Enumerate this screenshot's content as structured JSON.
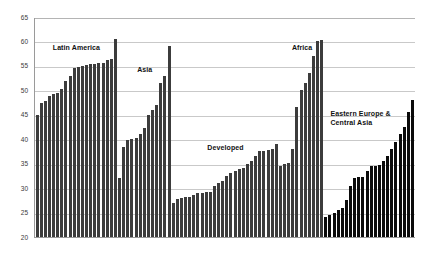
{
  "chart_data": {
    "type": "bar",
    "title": "",
    "subtitle": "",
    "xlabel": "",
    "ylabel": "",
    "ylim": [
      20,
      65
    ],
    "ytick_values": [
      20,
      25,
      30,
      35,
      40,
      45,
      50,
      55,
      60,
      65
    ],
    "ytick_labels": [
      "20",
      "25",
      "30",
      "35",
      "40",
      "45",
      "50",
      "55",
      "60",
      "65"
    ],
    "grid": "horizontal",
    "legend": "none",
    "bar_color": "#3c3c3c",
    "bar_color_alt": "#0b0b0b",
    "annotations": [
      {
        "text": "Latin America",
        "group": "Latin America"
      },
      {
        "text": "Asia",
        "group": "Asia"
      },
      {
        "text": "Developed",
        "group": "Developed"
      },
      {
        "text": "Africa",
        "group": "Africa"
      },
      {
        "text": "Eastern Europe &\nCentral Asia",
        "group": "Eastern Europe & Central Asia"
      }
    ],
    "groups": [
      {
        "name": "Latin America",
        "label": "Latin America",
        "shade": "medium",
        "values": [
          45.0,
          47.5,
          47.8,
          48.8,
          49.2,
          49.5,
          50.2,
          52.0,
          53.0,
          54.5,
          54.8,
          54.9,
          55.2,
          55.3,
          55.4,
          55.5,
          55.6,
          56.2,
          56.4,
          60.5
        ]
      },
      {
        "name": "Asia",
        "label": "Asia",
        "shade": "medium",
        "values": [
          32.0,
          38.5,
          39.8,
          40.0,
          40.2,
          41.0,
          42.3,
          45.0,
          46.0,
          47.0,
          51.5,
          53.0,
          59.0
        ]
      },
      {
        "name": "Developed",
        "label": "Developed",
        "shade": "medium",
        "values": [
          27.0,
          27.8,
          28.0,
          28.1,
          28.2,
          28.5,
          29.0,
          29.1,
          29.2,
          29.3,
          30.5,
          31.0,
          31.5,
          32.5,
          33.0,
          33.5,
          34.0,
          34.2,
          35.0,
          35.5,
          36.5,
          37.5,
          37.6,
          37.7,
          38.0,
          39.0
        ]
      },
      {
        "name": "Africa",
        "label": "Africa",
        "shade": "medium",
        "values": [
          34.5,
          35.0,
          35.2,
          38.0,
          46.5,
          50.0,
          51.5,
          53.5,
          57.0,
          60.0,
          60.2
        ]
      },
      {
        "name": "Eastern Europe & Central Asia",
        "label": "Eastern Europe &\nCentral Asia",
        "shade": "dark",
        "values": [
          24.0,
          24.5,
          25.0,
          25.5,
          26.0,
          27.5,
          30.5,
          32.0,
          32.2,
          32.3,
          33.5,
          34.5,
          34.6,
          34.7,
          35.5,
          36.5,
          38.0,
          39.5,
          41.0,
          42.5,
          45.5,
          48.0
        ]
      }
    ]
  }
}
